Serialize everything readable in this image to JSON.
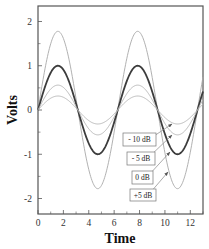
{
  "chart_data": {
    "type": "line",
    "title": "",
    "xlabel": "Time",
    "ylabel": "Volts",
    "xlim": [
      0,
      13
    ],
    "ylim": [
      -2.35,
      2.35
    ],
    "x_ticks": [
      0,
      2,
      4,
      6,
      8,
      10,
      12
    ],
    "x_minor_ticks": [
      1,
      3,
      5,
      7,
      9,
      11,
      13
    ],
    "y_ticks": [
      -2,
      -1,
      0,
      1,
      2
    ],
    "y_minor_ticks": [
      -1.5,
      -0.5,
      0.5,
      1.5
    ],
    "grid": false,
    "legend": "none (arrow annotations)",
    "function": "amplitude * sin(t)",
    "series": [
      {
        "name": "+5 dB",
        "amplitude": 1.778,
        "color": "#a8a8a8",
        "width": 0.9,
        "peaks": [
          [
            1.57,
            1.78
          ],
          [
            7.85,
            1.78
          ]
        ],
        "troughs": [
          [
            4.71,
            -1.78
          ],
          [
            11.0,
            -1.78
          ]
        ]
      },
      {
        "name": "0 dB",
        "amplitude": 1.0,
        "color": "#3c3c3c",
        "width": 1.8,
        "peaks": [
          [
            1.57,
            1.0
          ],
          [
            7.85,
            1.0
          ]
        ],
        "troughs": [
          [
            4.71,
            -1.0
          ],
          [
            11.0,
            -1.0
          ]
        ]
      },
      {
        "name": "- 5 dB",
        "amplitude": 0.562,
        "color": "#b4b4b4",
        "width": 0.9,
        "peaks": [
          [
            1.57,
            0.56
          ],
          [
            7.85,
            0.56
          ]
        ],
        "troughs": [
          [
            4.71,
            -0.56
          ],
          [
            11.0,
            -0.56
          ]
        ]
      },
      {
        "name": "- 10 dB",
        "amplitude": 0.316,
        "color": "#b4b4b4",
        "width": 0.9,
        "peaks": [
          [
            1.57,
            0.32
          ],
          [
            7.85,
            0.32
          ]
        ],
        "troughs": [
          [
            4.71,
            -0.32
          ],
          [
            11.0,
            -0.32
          ]
        ]
      }
    ],
    "annotations": [
      {
        "text": "- 10 dB",
        "box": [
          123,
          133,
          33,
          13
        ],
        "arrow_from": [
          148,
          140
        ],
        "arrow_to": [
          172,
          124
        ]
      },
      {
        "text": "- 5 dB",
        "box": [
          127,
          152,
          28,
          13
        ],
        "arrow_from": [
          148,
          158
        ],
        "arrow_to": [
          172,
          135
        ]
      },
      {
        "text": "0 dB",
        "box": [
          132,
          171,
          21,
          13
        ],
        "arrow_from": [
          148,
          176
        ],
        "arrow_to": [
          170,
          152
        ]
      },
      {
        "text": "+5 dB",
        "box": [
          130,
          189,
          26,
          12
        ],
        "arrow_from": [
          150,
          193
        ],
        "arrow_to": [
          168,
          172
        ]
      }
    ]
  },
  "layout": {
    "plot_left": 38,
    "plot_right": 203,
    "plot_top": 6,
    "plot_bottom": 214,
    "frame_color": "#555555"
  }
}
